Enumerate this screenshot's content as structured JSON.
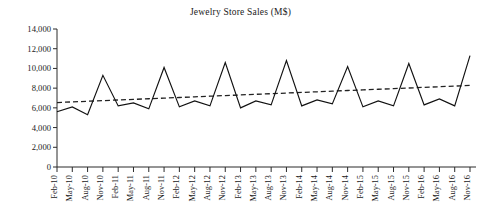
{
  "chart_data": {
    "type": "line",
    "title": "Jewelry Store Sales (M$)",
    "xlabel": "",
    "ylabel": "",
    "ylim": [
      0,
      14000
    ],
    "ytick_step": 2000,
    "yticks": [
      "0",
      "2,000",
      "4,000",
      "6,000",
      "8,000",
      "10,000",
      "12,000",
      "14,000"
    ],
    "ytick_values": [
      0,
      2000,
      4000,
      6000,
      8000,
      10000,
      12000,
      14000
    ],
    "grid": false,
    "legend": "none",
    "categories": [
      "Feb-10",
      "May-10",
      "Aug-10",
      "Nov-10",
      "Feb-11",
      "May-11",
      "Aug-11",
      "Nov-11",
      "Feb-12",
      "May-12",
      "Aug-12",
      "Nov-12",
      "Feb-13",
      "May-13",
      "Aug-13",
      "Nov-13",
      "Feb-14",
      "May-14",
      "Aug-14",
      "Nov-14",
      "Feb-15",
      "May-15",
      "Aug-15",
      "Nov-15",
      "Feb-16",
      "May-16",
      "Aug-16",
      "Nov-16"
    ],
    "series": [
      {
        "name": "Jewelry Store Sales",
        "style": "solid",
        "values": [
          5600,
          6100,
          5300,
          9300,
          6200,
          6500,
          5900,
          10100,
          6100,
          6700,
          6200,
          10600,
          6000,
          6700,
          6300,
          10800,
          6200,
          6800,
          6400,
          10200,
          6100,
          6700,
          6200,
          10500,
          6300,
          6900,
          6200,
          11300
        ]
      },
      {
        "name": "Linear trend",
        "style": "dashed",
        "values": [
          6540,
          6604,
          6668,
          6732,
          6797,
          6861,
          6925,
          6989,
          7053,
          7117,
          7181,
          7246,
          7310,
          7374,
          7438,
          7502,
          7566,
          7630,
          7695,
          7759,
          7823,
          7887,
          7951,
          8015,
          8079,
          8144,
          8208,
          8272
        ]
      }
    ]
  }
}
